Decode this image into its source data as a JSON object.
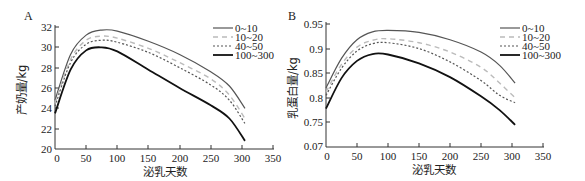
{
  "chart_data": [
    {
      "panel": "A",
      "type": "line",
      "title": "",
      "xlabel": "泌乳天数",
      "ylabel": "产奶量/kg",
      "xlim": [
        0,
        350
      ],
      "ylim": [
        20,
        32
      ],
      "xticks": [
        0,
        50,
        100,
        150,
        200,
        250,
        300,
        350
      ],
      "yticks": [
        20,
        22,
        24,
        26,
        28,
        30,
        32
      ],
      "grid": false,
      "legend_position": "upper right",
      "x": [
        0,
        25,
        50,
        75,
        100,
        150,
        200,
        250,
        280,
        305
      ],
      "series": [
        {
          "name": "0~10",
          "style": "solid-gray",
          "values": [
            24.8,
            29.3,
            31.2,
            31.7,
            31.6,
            30.6,
            29.3,
            27.6,
            26.2,
            24.0
          ]
        },
        {
          "name": "10~20",
          "style": "dashed-light",
          "values": [
            24.5,
            28.8,
            30.7,
            31.1,
            30.9,
            29.9,
            28.5,
            26.9,
            25.3,
            23.0
          ]
        },
        {
          "name": "40~50",
          "style": "dotted",
          "values": [
            24.2,
            28.5,
            30.3,
            30.7,
            30.5,
            29.5,
            28.0,
            26.3,
            24.8,
            22.5
          ]
        },
        {
          "name": "100~300",
          "style": "solid-black-thick",
          "values": [
            23.5,
            27.8,
            29.7,
            30.0,
            29.6,
            27.8,
            26.0,
            24.3,
            23.0,
            20.8
          ]
        }
      ]
    },
    {
      "panel": "B",
      "type": "line",
      "title": "",
      "xlabel": "泌乳天数",
      "ylabel": "乳蛋白量/kg",
      "xlim": [
        0,
        350
      ],
      "ylim": [
        0.7,
        0.95
      ],
      "xticks": [
        0,
        50,
        100,
        150,
        200,
        250,
        300,
        350
      ],
      "yticks": [
        0.07,
        0.75,
        0.8,
        0.85,
        0.9,
        0.95
      ],
      "grid": false,
      "legend_position": "upper right",
      "x": [
        0,
        25,
        50,
        75,
        100,
        150,
        200,
        250,
        280,
        305
      ],
      "series": [
        {
          "name": "0~10",
          "style": "solid-gray",
          "values": [
            0.82,
            0.88,
            0.918,
            0.934,
            0.937,
            0.933,
            0.918,
            0.893,
            0.866,
            0.83
          ]
        },
        {
          "name": "10~20",
          "style": "dashed-light",
          "values": [
            0.812,
            0.868,
            0.903,
            0.917,
            0.92,
            0.912,
            0.893,
            0.862,
            0.83,
            0.8
          ]
        },
        {
          "name": "40~50",
          "style": "dotted",
          "values": [
            0.805,
            0.86,
            0.895,
            0.91,
            0.912,
            0.9,
            0.873,
            0.835,
            0.805,
            0.79
          ]
        },
        {
          "name": "100~300",
          "style": "solid-black-thick",
          "values": [
            0.778,
            0.84,
            0.875,
            0.889,
            0.888,
            0.87,
            0.842,
            0.803,
            0.775,
            0.745
          ]
        }
      ]
    }
  ],
  "panels": {
    "A": {
      "label": "A",
      "ylabel": "产奶量/kg",
      "xlabel": "泌乳天数",
      "yticks": [
        "32",
        "30",
        "28",
        "26",
        "24",
        "22",
        "20"
      ],
      "xticks": [
        "0",
        "50",
        "100",
        "150",
        "200",
        "250",
        "300",
        "350"
      ],
      "legend": [
        "0~10",
        "10~20",
        "40~50",
        "100~300"
      ]
    },
    "B": {
      "label": "B",
      "ylabel": "乳蛋白量/kg",
      "xlabel": "泌乳天数",
      "yticks": [
        "0.95",
        "0.9",
        "0.85",
        "0.8",
        "0.75",
        "0.07"
      ],
      "xticks": [
        "0",
        "50",
        "100",
        "150",
        "200",
        "250",
        "300",
        "350"
      ],
      "legend": [
        "0~10",
        "10~20",
        "40~50",
        "100~300"
      ]
    }
  },
  "colors": {
    "axis": "#333333",
    "series_0_10": "#555555",
    "series_10_20": "#bbbbbb",
    "series_40_50": "#555555",
    "series_100_300": "#111111"
  }
}
